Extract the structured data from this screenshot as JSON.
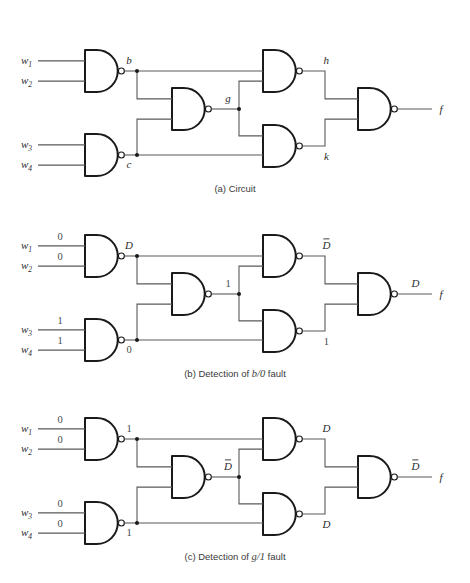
{
  "figure": {
    "background": "#ffffff",
    "gate_type": "NAND",
    "wire_color": "#5a5a5a",
    "gate_color": "#1a1a1a"
  },
  "panels": [
    {
      "id": "a",
      "caption_prefix": "(a)",
      "caption_text": "Circuit",
      "caption_italic": "",
      "caption_suffix": "",
      "inputs": [
        {
          "name": "w",
          "sub": "1",
          "value": ""
        },
        {
          "name": "w",
          "sub": "2",
          "value": ""
        },
        {
          "name": "w",
          "sub": "3",
          "value": ""
        },
        {
          "name": "w",
          "sub": "4",
          "value": ""
        }
      ],
      "nodes": [
        {
          "id": "b",
          "label": "b",
          "overbar": false,
          "italic": true
        },
        {
          "id": "c",
          "label": "c",
          "overbar": false,
          "italic": true
        },
        {
          "id": "g",
          "label": "g",
          "overbar": false,
          "italic": true
        },
        {
          "id": "h",
          "label": "h",
          "overbar": false,
          "italic": true
        },
        {
          "id": "k",
          "label": "k",
          "overbar": false,
          "italic": true
        },
        {
          "id": "f",
          "label": "f",
          "overbar": false,
          "italic": true
        }
      ],
      "output_label": "f"
    },
    {
      "id": "b",
      "caption_prefix": "(b)",
      "caption_text": "Detection of",
      "caption_italic": "b/0",
      "caption_suffix": "fault",
      "inputs": [
        {
          "name": "w",
          "sub": "1",
          "value": "0"
        },
        {
          "name": "w",
          "sub": "2",
          "value": "0"
        },
        {
          "name": "w",
          "sub": "3",
          "value": "1"
        },
        {
          "name": "w",
          "sub": "4",
          "value": "1"
        }
      ],
      "nodes": [
        {
          "id": "b",
          "label": "D",
          "overbar": false,
          "italic": true
        },
        {
          "id": "c",
          "label": "0",
          "overbar": false,
          "italic": false
        },
        {
          "id": "g",
          "label": "1",
          "overbar": false,
          "italic": false
        },
        {
          "id": "h",
          "label": "D",
          "overbar": true,
          "italic": true
        },
        {
          "id": "k",
          "label": "1",
          "overbar": false,
          "italic": false
        },
        {
          "id": "f",
          "label": "D",
          "overbar": false,
          "italic": true
        }
      ],
      "output_label": "f"
    },
    {
      "id": "c",
      "caption_prefix": "(c)",
      "caption_text": "Detection of",
      "caption_italic": "g/1",
      "caption_suffix": "fault",
      "inputs": [
        {
          "name": "w",
          "sub": "1",
          "value": "0"
        },
        {
          "name": "w",
          "sub": "2",
          "value": "0"
        },
        {
          "name": "w",
          "sub": "3",
          "value": "0"
        },
        {
          "name": "w",
          "sub": "4",
          "value": "0"
        }
      ],
      "nodes": [
        {
          "id": "b",
          "label": "1",
          "overbar": false,
          "italic": false
        },
        {
          "id": "c",
          "label": "1",
          "overbar": false,
          "italic": false
        },
        {
          "id": "g",
          "label": "D",
          "overbar": true,
          "italic": true
        },
        {
          "id": "h",
          "label": "D",
          "overbar": false,
          "italic": true
        },
        {
          "id": "k",
          "label": "D",
          "overbar": false,
          "italic": true
        },
        {
          "id": "f",
          "label": "D",
          "overbar": true,
          "italic": true
        }
      ],
      "output_label": "f"
    }
  ],
  "geometry": {
    "panel_tops": [
      10,
      195,
      378
    ],
    "gates": {
      "g_b": {
        "x": 85,
        "y": 40,
        "w": 28,
        "h": 42
      },
      "g_c": {
        "x": 85,
        "y": 124,
        "w": 28,
        "h": 42
      },
      "g_g": {
        "x": 172,
        "y": 78,
        "w": 28,
        "h": 42
      },
      "g_h": {
        "x": 263,
        "y": 40,
        "w": 28,
        "h": 42
      },
      "g_k": {
        "x": 263,
        "y": 115,
        "w": 28,
        "h": 42
      },
      "g_f": {
        "x": 358,
        "y": 78,
        "w": 28,
        "h": 42
      }
    }
  }
}
